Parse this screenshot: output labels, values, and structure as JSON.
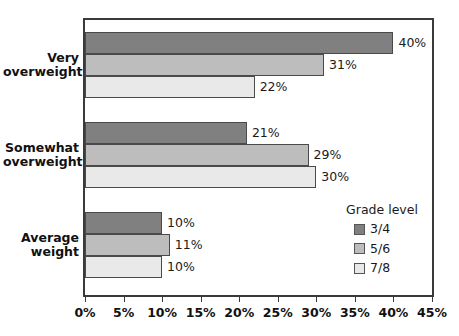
{
  "chart_data": {
    "type": "bar",
    "orientation": "horizontal",
    "title": "",
    "xlabel": "",
    "ylabel": "",
    "categories": [
      "Very overweight",
      "Somewhat overweight",
      "Average weight"
    ],
    "category_lines": [
      [
        "Very",
        "overweight"
      ],
      [
        "Somewhat",
        "overweight"
      ],
      [
        "Average",
        "weight"
      ]
    ],
    "series": [
      {
        "name": "3/4",
        "color": "#808080",
        "values": [
          40,
          31,
          22
        ]
      },
      {
        "name": "5/6",
        "color": "#bdbdbd",
        "values": [
          21,
          29,
          30
        ]
      },
      {
        "name": "7/8",
        "color": "#e9e9e9",
        "values": [
          10,
          11,
          10
        ]
      }
    ],
    "bar_groups": [
      {
        "category": "Very overweight",
        "bars": [
          {
            "series": "3/4",
            "value": 40,
            "label": "40%",
            "color": "#808080"
          },
          {
            "series": "5/6",
            "value": 31,
            "label": "31%",
            "color": "#bdbdbd"
          },
          {
            "series": "7/8",
            "value": 22,
            "label": "22%",
            "color": "#e9e9e9"
          }
        ]
      },
      {
        "category": "Somewhat overweight",
        "bars": [
          {
            "series": "3/4",
            "value": 21,
            "label": "21%",
            "color": "#808080"
          },
          {
            "series": "5/6",
            "value": 29,
            "label": "29%",
            "color": "#bdbdbd"
          },
          {
            "series": "7/8",
            "value": 30,
            "label": "30%",
            "color": "#e9e9e9"
          }
        ]
      },
      {
        "category": "Average weight",
        "bars": [
          {
            "series": "3/4",
            "value": 10,
            "label": "10%",
            "color": "#808080"
          },
          {
            "series": "5/6",
            "value": 11,
            "label": "11%",
            "color": "#bdbdbd"
          },
          {
            "series": "7/8",
            "value": 10,
            "label": "10%",
            "color": "#e9e9e9"
          }
        ]
      }
    ],
    "xlim": [
      0,
      45
    ],
    "xticks": [
      0,
      5,
      10,
      15,
      20,
      25,
      30,
      35,
      40,
      45
    ],
    "xticklabels": [
      "0%",
      "5%",
      "10%",
      "15%",
      "20%",
      "25%",
      "30%",
      "35%",
      "40%",
      "45%"
    ],
    "grid": false,
    "legend": {
      "title": "Grade level",
      "position": "inside-lower-right",
      "entries": [
        {
          "label": "3/4",
          "color": "#808080"
        },
        {
          "label": "5/6",
          "color": "#bdbdbd"
        },
        {
          "label": "7/8",
          "color": "#e9e9e9"
        }
      ]
    },
    "colors": {
      "axis": "#3a3a3a",
      "text": "#111111",
      "background": "#ffffff",
      "bar_border": "#4a4a4a"
    }
  }
}
